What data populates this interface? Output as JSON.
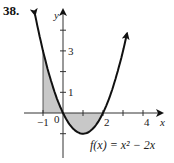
{
  "problem": {
    "number": "38."
  },
  "function_label": "f(x) = x² − 2x",
  "colors": {
    "curve": "#111111",
    "shade": "#c8c8c8",
    "axis": "#333333"
  },
  "chart_data": {
    "type": "area",
    "title": "",
    "function": "x^2 - 2x",
    "xlabel": "x",
    "ylabel": "y",
    "xlim": [
      -1.0,
      5.0
    ],
    "ylim": [
      -1.5,
      4.9
    ],
    "x_ticks": [
      -1,
      0,
      1,
      2,
      3,
      4
    ],
    "x_tick_labels": [
      "-1",
      "0",
      "",
      "2",
      "",
      "4"
    ],
    "y_ticks": [
      -1,
      1,
      2,
      3,
      4
    ],
    "y_tick_labels": [
      "",
      "1",
      "",
      "3",
      ""
    ],
    "grid": false,
    "shaded_region": {
      "from": -1,
      "to": 2,
      "description": "area between curve and x-axis"
    },
    "series": [
      {
        "name": "f(x) = x^2 - 2x",
        "x": [
          -1.4,
          -1,
          -0.5,
          0,
          0.5,
          1,
          1.5,
          2,
          2.5,
          3,
          3.2
        ],
        "values": [
          4.76,
          3,
          1.25,
          0,
          -0.75,
          -1,
          -0.75,
          0,
          1.25,
          3,
          3.84
        ]
      }
    ]
  }
}
